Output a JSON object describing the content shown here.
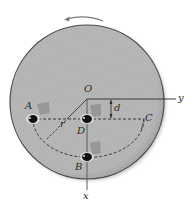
{
  "diagram": {
    "type": "rotating-platform-kinematics",
    "rotation_direction": "counterclockwise",
    "labels": {
      "origin": "O",
      "y_axis": "y",
      "x_axis": "x",
      "point_a": "A",
      "point_b": "B",
      "point_c": "C",
      "point_d": "D",
      "offset": "d",
      "radius": "r"
    },
    "colors": {
      "platform_fill": "#b3b3b3",
      "platform_edge": "#4a4a4a",
      "line": "#3a3a3a",
      "arrow": "#7a7a7a",
      "object": "#111111",
      "shadow": "#8d8d8d"
    }
  }
}
